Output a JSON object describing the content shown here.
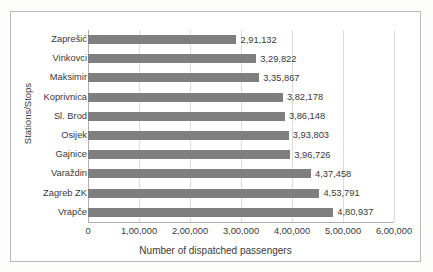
{
  "chart_data": {
    "type": "bar",
    "orientation": "horizontal",
    "title": "",
    "xlabel": "Number of dispatched passengers",
    "ylabel": "Stations/Stops",
    "categories": [
      "Zaprešić",
      "Vinkovci",
      "Maksimir",
      "Koprivnica",
      "Sl. Brod",
      "Osijek",
      "Gajnice",
      "Varaždin",
      "Zagreb ZK",
      "Vrapče"
    ],
    "values": [
      291132,
      329822,
      335867,
      382178,
      386148,
      393803,
      396726,
      437458,
      453791,
      480937
    ],
    "value_labels": [
      "2,91,132",
      "3,29,822",
      "3,35,867",
      "3,82,178",
      "3,86,148",
      "3,93,803",
      "3,96,726",
      "4,37,458",
      "4,53,791",
      "4,80,937"
    ],
    "xlim": [
      0,
      600000
    ],
    "xticks": [
      0,
      100000,
      200000,
      300000,
      400000,
      500000,
      600000
    ],
    "xtick_labels": [
      "0",
      "1,00,000",
      "2,00,000",
      "3,00,000",
      "4,00,000",
      "5,00,000",
      "6,00,000"
    ],
    "grid": true,
    "grid_axis": "x",
    "legend": "none",
    "bar_color": "#7f7f7f",
    "grid_color": "#dcdcdc",
    "axis_color": "#b0b0b0",
    "text_color": "#3a3a3a",
    "background": "#ffffff"
  }
}
